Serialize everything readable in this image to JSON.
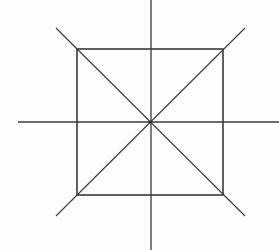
{
  "diagram": {
    "type": "geometric-figure",
    "canvas": {
      "width": 279,
      "height": 250
    },
    "stroke_color": "#3a3a3a",
    "background_color": "#fdfdfd",
    "square": {
      "x": 77,
      "y": 49,
      "width": 146,
      "height": 146,
      "stroke_width": 1.6
    },
    "center": {
      "x": 150,
      "y": 122
    },
    "lines": [
      {
        "name": "horizontal-axis",
        "x1": 18,
        "y1": 122,
        "x2": 279,
        "y2": 122,
        "stroke_width": 1.3
      },
      {
        "name": "vertical-axis",
        "x1": 151,
        "y1": 0,
        "x2": 151,
        "y2": 250,
        "stroke_width": 1.3
      },
      {
        "name": "diagonal-main",
        "x1": 56,
        "y1": 28,
        "x2": 245,
        "y2": 216,
        "stroke_width": 1.1
      },
      {
        "name": "diagonal-anti",
        "x1": 56,
        "y1": 216,
        "x2": 245,
        "y2": 28,
        "stroke_width": 1.1
      }
    ],
    "background_text_legible": false
  }
}
